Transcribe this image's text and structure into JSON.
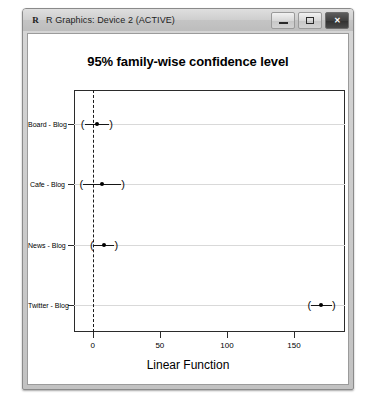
{
  "window": {
    "title": "R Graphics: Device 2 (ACTIVE)",
    "app_icon_glyph": "R",
    "controls": {
      "minimize_label": "Minimize",
      "maximize_label": "Maximize",
      "close_label": "✕"
    }
  },
  "chart_data": {
    "type": "scatter",
    "title": "95% family-wise confidence level",
    "xlabel": "Linear Function",
    "ylabel": "",
    "xlim": [
      -14,
      188
    ],
    "xticks": [
      0,
      50,
      100,
      150
    ],
    "xtick_labels": [
      "0",
      "50",
      "100",
      "150"
    ],
    "grid": true,
    "legend": null,
    "reference_line": {
      "x": 0,
      "style": "dashed"
    },
    "categories": [
      "Board - Blog",
      "Cafe - Blog",
      "News - Blog",
      "Twitter - Blog"
    ],
    "series": [
      {
        "name": "difference in means with 95% family-wise CI",
        "points": [
          {
            "category": "Board - Blog",
            "estimate": 3,
            "lower": -6,
            "upper": 12
          },
          {
            "category": "Cafe - Blog",
            "estimate": 7,
            "lower": -7,
            "upper": 21
          },
          {
            "category": "News - Blog",
            "estimate": 8,
            "lower": 1,
            "upper": 16
          },
          {
            "category": "Twitter - Blog",
            "estimate": 170,
            "lower": 163,
            "upper": 178
          }
        ]
      }
    ]
  }
}
